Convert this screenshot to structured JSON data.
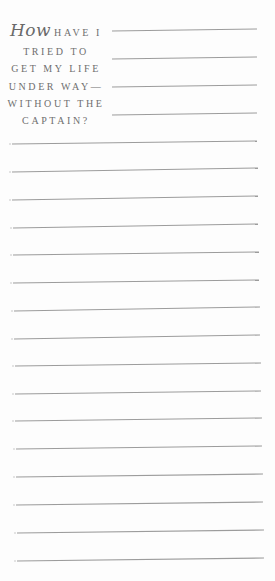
{
  "prompt": {
    "lead_word": "How",
    "lines": [
      "HAVE I",
      "TRIED TO",
      "GET MY LIFE",
      "UNDER WAY—",
      "WITHOUT THE",
      "CAPTAIN?"
    ]
  },
  "colors": {
    "text": "#6f6f6f",
    "rule": "#9c9c9c",
    "background": "#fdfdfd"
  },
  "header_rules": [
    {
      "x1": 112,
      "y1": 31,
      "x2": 257,
      "y2": 29
    },
    {
      "x1": 112,
      "y1": 59,
      "x2": 257,
      "y2": 57
    },
    {
      "x1": 112,
      "y1": 87,
      "x2": 257,
      "y2": 85
    },
    {
      "x1": 112,
      "y1": 115,
      "x2": 257,
      "y2": 113
    }
  ],
  "writing_rules": [
    {
      "x1": 12,
      "y1": 144,
      "x2": 257,
      "y2": 141
    },
    {
      "x1": 12,
      "y1": 172,
      "x2": 258,
      "y2": 168
    },
    {
      "x1": 12,
      "y1": 200,
      "x2": 258,
      "y2": 196
    },
    {
      "x1": 13,
      "y1": 228,
      "x2": 258,
      "y2": 224
    },
    {
      "x1": 13,
      "y1": 255,
      "x2": 259,
      "y2": 252
    },
    {
      "x1": 13,
      "y1": 283,
      "x2": 259,
      "y2": 280
    },
    {
      "x1": 14,
      "y1": 311,
      "x2": 260,
      "y2": 307
    },
    {
      "x1": 14,
      "y1": 339,
      "x2": 260,
      "y2": 335
    },
    {
      "x1": 15,
      "y1": 366,
      "x2": 261,
      "y2": 363
    },
    {
      "x1": 15,
      "y1": 394,
      "x2": 261,
      "y2": 391
    },
    {
      "x1": 15,
      "y1": 421,
      "x2": 262,
      "y2": 418
    },
    {
      "x1": 16,
      "y1": 449,
      "x2": 262,
      "y2": 446
    },
    {
      "x1": 16,
      "y1": 477,
      "x2": 263,
      "y2": 474
    },
    {
      "x1": 16,
      "y1": 505,
      "x2": 263,
      "y2": 502
    },
    {
      "x1": 17,
      "y1": 533,
      "x2": 264,
      "y2": 530
    },
    {
      "x1": 17,
      "y1": 561,
      "x2": 264,
      "y2": 558
    }
  ]
}
